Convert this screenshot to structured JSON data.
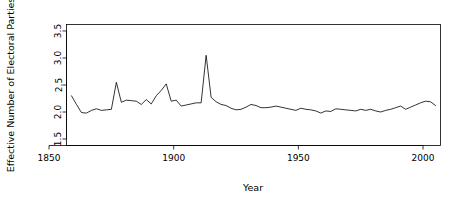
{
  "figure": {
    "width": 459,
    "height": 205,
    "background": "#ffffff",
    "foreground": "#000000",
    "line_color": "#000000"
  },
  "chart_data": {
    "type": "line",
    "title": "",
    "xlabel": "Year",
    "ylabel": "Effective Number of Electoral Parties",
    "xlim": [
      1857,
      2007
    ],
    "ylim": [
      1.38,
      3.62
    ],
    "xticks": [
      1850,
      1900,
      1950,
      2000
    ],
    "xtick_labels": [
      "1850",
      "1900",
      "1950",
      "2000"
    ],
    "yticks": [
      1.5,
      2.0,
      2.5,
      3.0,
      3.5
    ],
    "ytick_labels": [
      "1.5",
      "2.0",
      "2.5",
      "3.0",
      "3.5"
    ],
    "grid": false,
    "legend": null,
    "series": [
      {
        "name": "Effective Number of Electoral Parties",
        "color": "#000000",
        "x": [
          1859,
          1861,
          1863,
          1865,
          1867,
          1869,
          1871,
          1873,
          1875,
          1877,
          1879,
          1881,
          1883,
          1885,
          1887,
          1889,
          1891,
          1893,
          1895,
          1897,
          1899,
          1901,
          1903,
          1905,
          1907,
          1909,
          1911,
          1913,
          1915,
          1917,
          1919,
          1921,
          1923,
          1925,
          1927,
          1929,
          1931,
          1933,
          1935,
          1937,
          1939,
          1941,
          1943,
          1945,
          1947,
          1949,
          1951,
          1953,
          1955,
          1957,
          1959,
          1961,
          1963,
          1965,
          1967,
          1969,
          1971,
          1973,
          1975,
          1977,
          1979,
          1981,
          1983,
          1985,
          1987,
          1989,
          1991,
          1993,
          1995,
          1997,
          1999,
          2001,
          2003,
          2005
        ],
        "y": [
          2.3,
          2.14,
          1.99,
          1.98,
          2.03,
          2.06,
          2.03,
          2.04,
          2.05,
          2.55,
          2.18,
          2.22,
          2.21,
          2.2,
          2.14,
          2.23,
          2.15,
          2.3,
          2.4,
          2.52,
          2.2,
          2.22,
          2.11,
          2.13,
          2.15,
          2.17,
          2.17,
          3.05,
          2.27,
          2.19,
          2.14,
          2.12,
          2.07,
          2.04,
          2.05,
          2.09,
          2.14,
          2.12,
          2.08,
          2.08,
          2.09,
          2.11,
          2.09,
          2.07,
          2.05,
          2.03,
          2.07,
          2.05,
          2.04,
          2.02,
          1.98,
          2.02,
          2.01,
          2.06,
          2.05,
          2.04,
          2.03,
          2.02,
          2.05,
          2.03,
          2.05,
          2.02,
          2.0,
          2.03,
          2.05,
          2.08,
          2.11,
          2.05,
          2.09,
          2.13,
          2.17,
          2.2,
          2.19,
          2.12
        ]
      }
    ]
  }
}
